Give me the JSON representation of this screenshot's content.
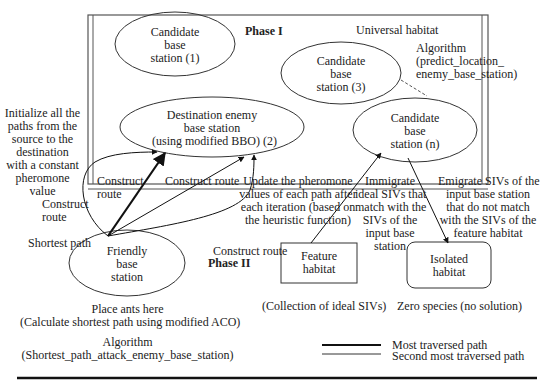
{
  "diagram": {
    "phase1_label": "Phase I",
    "phase2_label": "Phase II",
    "universal_habitat": "Universal habitat",
    "algorithm1": [
      "Algorithm",
      "(predict_location_",
      "enemy_base_station)"
    ],
    "nodes": {
      "candidate1": [
        "Candidate",
        "base",
        "station (1)"
      ],
      "candidate3": [
        "Candidate",
        "base",
        "station (3)"
      ],
      "candidaten": [
        "Candidate",
        "base",
        "station (n)"
      ],
      "destination": [
        "Destination enemy",
        "base station",
        "(using modified BBO) (2)"
      ],
      "friendly": [
        "Friendly",
        "base",
        "station"
      ],
      "feature": [
        "Feature",
        "habitat"
      ],
      "isolated": [
        "Isolated",
        "habitat"
      ]
    },
    "annotations": {
      "initialize": [
        "Initialize all the",
        "paths from the",
        "source to the",
        "destination",
        "with a constant",
        "pheromone",
        "value"
      ],
      "construct_route_left": [
        "Construct",
        "route"
      ],
      "construct_route_inner": [
        "Construct",
        "route"
      ],
      "construct_route_mid": "Construct route",
      "construct_route_right": "Construct route",
      "shortest_path": "Shortest path",
      "update_pheromone": [
        "Update the pheromone",
        "values of each path after",
        "each iteration (based on",
        "the heuristic function)"
      ],
      "immigrate": [
        "Immigrate",
        "ideal SIVs that",
        "match with the",
        "SIVs of the",
        "input base",
        "station"
      ],
      "emigrate": [
        "Emigrate SIVs of the",
        "input base station",
        "that do not match",
        "with the SIVs of the",
        "feature habitat"
      ],
      "feature_caption": "(Collection of ideal SIVs)",
      "isolated_caption": "Zero species (no solution)",
      "place_ants": "Place ants here",
      "calc_shortest": "(Calculate shortest path using modified ACO)",
      "algorithm2": "Algorithm",
      "algorithm2_name": "(Shortest_path_attack_enemy_base_station)"
    },
    "legend": {
      "most": "Most traversed path",
      "second": "Second most traversed path"
    }
  }
}
